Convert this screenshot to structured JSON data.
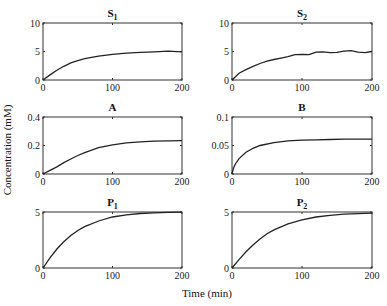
{
  "chart_data": [
    {
      "type": "line",
      "title": "S",
      "subscript": "1",
      "x": [
        0,
        10,
        20,
        30,
        40,
        50,
        60,
        80,
        100,
        120,
        140,
        160,
        180,
        200
      ],
      "series": [
        {
          "name": "S1",
          "values": [
            0,
            0.9,
            1.7,
            2.4,
            3.0,
            3.4,
            3.75,
            4.2,
            4.5,
            4.7,
            4.85,
            4.95,
            5.05,
            4.95
          ]
        }
      ],
      "xlim": [
        0,
        200
      ],
      "ylim": [
        0,
        10
      ],
      "xticks": [
        "0",
        "100",
        "200"
      ],
      "yticks": [
        "0",
        "5",
        "10"
      ]
    },
    {
      "type": "line",
      "title": "S",
      "subscript": "2",
      "x": [
        0,
        10,
        20,
        30,
        40,
        50,
        60,
        70,
        80,
        90,
        100,
        110,
        120,
        130,
        140,
        150,
        160,
        170,
        180,
        190,
        200
      ],
      "series": [
        {
          "name": "S2",
          "values": [
            0,
            1.2,
            1.8,
            2.4,
            2.9,
            3.3,
            3.6,
            3.85,
            4.1,
            4.45,
            4.5,
            4.45,
            4.9,
            4.95,
            4.8,
            4.85,
            5.05,
            5.15,
            4.9,
            4.8,
            5.0
          ]
        }
      ],
      "xlim": [
        0,
        200
      ],
      "ylim": [
        0,
        10
      ],
      "xticks": [
        "0",
        "100",
        "200"
      ],
      "yticks": [
        "0",
        "5",
        "10"
      ]
    },
    {
      "type": "line",
      "title": "A",
      "subscript": "",
      "x": [
        0,
        10,
        20,
        30,
        40,
        50,
        60,
        80,
        100,
        120,
        140,
        160,
        180,
        200
      ],
      "series": [
        {
          "name": "A",
          "values": [
            0,
            0.025,
            0.05,
            0.08,
            0.105,
            0.13,
            0.15,
            0.185,
            0.205,
            0.218,
            0.226,
            0.231,
            0.233,
            0.234
          ]
        }
      ],
      "xlim": [
        0,
        200
      ],
      "ylim": [
        0,
        0.4
      ],
      "xticks": [
        "0",
        "100",
        "200"
      ],
      "yticks": [
        "0",
        "0.2",
        "0.4"
      ]
    },
    {
      "type": "line",
      "title": "B",
      "subscript": "",
      "x": [
        0,
        2,
        5,
        10,
        20,
        30,
        40,
        60,
        80,
        100,
        120,
        140,
        160,
        180,
        200
      ],
      "series": [
        {
          "name": "B",
          "values": [
            0,
            0.01,
            0.018,
            0.027,
            0.038,
            0.045,
            0.05,
            0.055,
            0.058,
            0.0595,
            0.06,
            0.0605,
            0.061,
            0.061,
            0.061
          ]
        }
      ],
      "xlim": [
        0,
        200
      ],
      "ylim": [
        0,
        0.1
      ],
      "xticks": [
        "0",
        "100",
        "200"
      ],
      "yticks": [
        "0",
        "0.05",
        "0.1"
      ]
    },
    {
      "type": "line",
      "title": "P",
      "subscript": "1",
      "x": [
        0,
        10,
        20,
        30,
        40,
        50,
        60,
        80,
        100,
        120,
        140,
        160,
        180,
        200
      ],
      "series": [
        {
          "name": "P1",
          "values": [
            0,
            0.9,
            1.7,
            2.35,
            2.9,
            3.35,
            3.7,
            4.2,
            4.55,
            4.75,
            4.87,
            4.93,
            4.96,
            4.98
          ]
        }
      ],
      "xlim": [
        0,
        200
      ],
      "ylim": [
        0,
        5
      ],
      "xticks": [
        "0",
        "100",
        "200"
      ],
      "yticks": [
        "0",
        "5"
      ]
    },
    {
      "type": "line",
      "title": "P",
      "subscript": "2",
      "x": [
        0,
        10,
        20,
        30,
        40,
        50,
        60,
        80,
        100,
        120,
        140,
        160,
        180,
        200
      ],
      "series": [
        {
          "name": "P2",
          "values": [
            0,
            0.75,
            1.45,
            2.05,
            2.6,
            3.05,
            3.4,
            3.95,
            4.3,
            4.55,
            4.7,
            4.8,
            4.86,
            4.9
          ]
        }
      ],
      "xlim": [
        0,
        200
      ],
      "ylim": [
        0,
        5
      ],
      "xticks": [
        "0",
        "100",
        "200"
      ],
      "yticks": [
        "0",
        "5"
      ]
    }
  ],
  "labels": {
    "ylabel": "Concentration (mM)",
    "xlabel": "Time (min)"
  }
}
